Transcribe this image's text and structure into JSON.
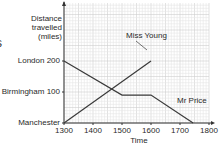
{
  "chart_data": {
    "type": "line",
    "title": "",
    "xlabel": "Time",
    "ylabel": "Distance travelled (miles)",
    "ylabel_lines": [
      "Distance",
      "travelled",
      "(miles)"
    ],
    "x_ticks": [
      1300,
      1400,
      1500,
      1600,
      1700,
      1800
    ],
    "x_tick_labels": [
      "1300",
      "1400",
      "1500",
      "1600",
      "1700",
      "1800"
    ],
    "y_ticks": [
      0,
      100,
      200
    ],
    "y_tick_labels": [
      "Manchester",
      "Birmingham 100",
      "London 200"
    ],
    "xlim": [
      1300,
      1800
    ],
    "ylim": [
      0,
      390
    ],
    "grid": true,
    "series": [
      {
        "name": "Mr Price",
        "points": [
          [
            1300,
            200
          ],
          [
            1500,
            90
          ],
          [
            1600,
            90
          ],
          [
            1745,
            0
          ]
        ]
      },
      {
        "name": "Miss Young",
        "points": [
          [
            1300,
            0
          ],
          [
            1600,
            200
          ]
        ]
      }
    ],
    "annotations": [
      {
        "text": "Miss Young",
        "leader_to": [
          1480,
          120
        ]
      },
      {
        "text": "Mr Price"
      }
    ]
  },
  "labels": {
    "ylabel_1": "Distance",
    "ylabel_2": "travelled",
    "ylabel_3": "(miles)",
    "london": "London 200",
    "birmingham": "Birmingham 100",
    "manchester": "Manchester",
    "x1300": "1300",
    "x1400": "1400",
    "x1500": "1500",
    "x1600": "1600",
    "x1700": "1700",
    "x1800": "1800",
    "xlabel": "Time",
    "miss_young": "Miss Young",
    "mr_price": "Mr Price",
    "clipped_glyph": "s"
  },
  "colors": {
    "line": "#3a3a3a",
    "grid_minor": "#e6e6e6",
    "grid_major": "#cfcfcf",
    "axis": "#333333"
  }
}
